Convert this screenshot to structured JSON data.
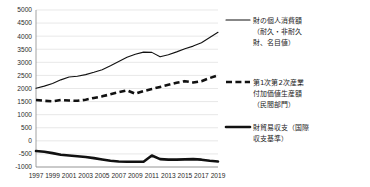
{
  "chart_data": {
    "type": "line",
    "title": "",
    "xlabel": "",
    "ylabel": "",
    "ylim": [
      -1000,
      5000
    ],
    "ytick_step": 500,
    "grid": true,
    "legend_position": "right",
    "ytick_labels": [
      "5000",
      "4500",
      "4000",
      "3500",
      "3000",
      "2500",
      "2000",
      "1500",
      "1000",
      "500",
      "0",
      "-500",
      "-1000"
    ],
    "x": [
      1997,
      1998,
      1999,
      2000,
      2001,
      2002,
      2003,
      2004,
      2005,
      2006,
      2007,
      2008,
      2009,
      2010,
      2011,
      2012,
      2013,
      2014,
      2015,
      2016,
      2017,
      2018,
      2019
    ],
    "xtick_labels": [
      "1997",
      "1999",
      "2001",
      "2003",
      "2005",
      "2007",
      "2009",
      "2011",
      "2013",
      "2015",
      "2017",
      "2019"
    ],
    "series": [
      {
        "name": "財の個人消費額（耐久・非耐久財、名目値）",
        "style": "solid-thin",
        "legend_label_lines": [
          "財の個人消費額",
          "（耐久・非耐久",
          "財、名目値）"
        ],
        "values": [
          2010,
          2090,
          2190,
          2330,
          2440,
          2470,
          2530,
          2620,
          2720,
          2870,
          3030,
          3190,
          3310,
          3390,
          3380,
          3210,
          3290,
          3400,
          3520,
          3620,
          3750,
          3950,
          4150
        ]
      },
      {
        "name": "第1次第2次産業付加価値生産額（民間部門）",
        "style": "dashed-thick",
        "legend_label_lines": [
          "第1次第2次産業",
          "付加価値生産額",
          "（民間部門）"
        ],
        "values": [
          1560,
          1530,
          1510,
          1560,
          1540,
          1530,
          1570,
          1640,
          1700,
          1780,
          1860,
          1930,
          1800,
          1900,
          1980,
          2060,
          2140,
          2220,
          2280,
          2230,
          2280,
          2400,
          2500
        ]
      },
      {
        "name": "財貿易収支（国際収支基準）",
        "style": "solid-thick",
        "legend_label_lines": [
          "財貿易収支（国際",
          "収支基準）"
        ],
        "values": [
          -390,
          -420,
          -470,
          -530,
          -560,
          -590,
          -620,
          -660,
          -710,
          -760,
          -790,
          -800,
          -800,
          -800,
          -560,
          -700,
          -720,
          -720,
          -710,
          -700,
          -720,
          -760,
          -790
        ]
      }
    ]
  },
  "legend": {
    "items": [
      {
        "marker": "solid-thin-marker",
        "lines": [
          "財の個人消費額",
          "（耐久・非耐久",
          "財、名目値）"
        ]
      },
      {
        "marker": "dashed-thick-marker",
        "lines": [
          "第1次第2次産業",
          "付加価値生産額",
          "（民間部門）"
        ]
      },
      {
        "marker": "solid-thick-marker",
        "lines": [
          "財貿易収支（国際",
          "収支基準）"
        ]
      }
    ]
  }
}
